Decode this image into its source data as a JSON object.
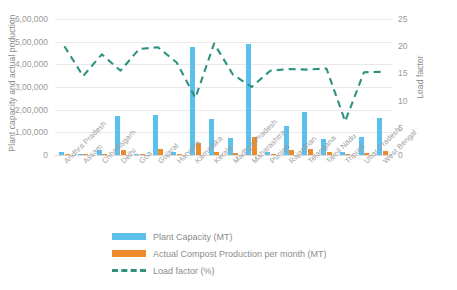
{
  "chart_data": {
    "type": "bar",
    "title": "",
    "xlabel": "",
    "ylabel": "Plant capacity and actual poduction",
    "y2label": "Load factor",
    "ylim": [
      0,
      600000
    ],
    "y2lim": [
      0,
      25
    ],
    "grid": true,
    "legend_position": "bottom",
    "categories": [
      "Andhra Pradesh",
      "Assam",
      "Chhattisgarh",
      "Delhi",
      "Goa",
      "Gujarat",
      "Haryana",
      "Karnataka",
      "Kerala",
      "Madhya Pradesh",
      "Maharashtra",
      "Punjab",
      "Rajasthan",
      "Telangana",
      "Tamil Nadu",
      "Tripura",
      "Uttar Pradesh",
      "West Bengal"
    ],
    "yticks": [
      "0",
      "1,00,000",
      "2,00,000",
      "3,00,000",
      "4,00,000",
      "5,00,000",
      "6,00,000"
    ],
    "ytick_values": [
      0,
      100000,
      200000,
      300000,
      400000,
      500000,
      600000
    ],
    "y2ticks": [
      "0",
      "5",
      "10",
      "15",
      "20",
      "25"
    ],
    "y2tick_values": [
      0,
      5,
      10,
      15,
      20,
      25
    ],
    "series": [
      {
        "name": "Plant Capacity (MT)",
        "type": "bar",
        "axis": "left",
        "color": "#5bc0eb",
        "values": [
          13000,
          6000,
          22000,
          172000,
          5000,
          176000,
          12000,
          475000,
          160000,
          76000,
          490000,
          13000,
          130000,
          190000,
          70000,
          14000,
          80000,
          165000
        ]
      },
      {
        "name": "Actual Compost Production per month (MT)",
        "type": "bar",
        "axis": "left",
        "color": "#ed8b2b",
        "values": [
          5000,
          1500,
          4000,
          20000,
          1000,
          26000,
          2000,
          55000,
          12000,
          8000,
          78000,
          3000,
          22000,
          26000,
          14000,
          2000,
          9000,
          17000
        ]
      },
      {
        "name": "Load factor (%)",
        "type": "line",
        "axis": "right",
        "color": "#2e9182",
        "dashed": true,
        "values": [
          20.0,
          14.5,
          18.5,
          15.5,
          19.5,
          19.8,
          17.0,
          10.5,
          20.5,
          14.8,
          12.5,
          15.5,
          15.8,
          15.7,
          15.9,
          6.2,
          15.2,
          15.3
        ]
      }
    ]
  },
  "legend": {
    "items": [
      {
        "label": "Plant Capacity (MT)",
        "swatch": "cap"
      },
      {
        "label": "Actual Compost Production per month (MT)",
        "swatch": "prod"
      },
      {
        "label": "Load factor (%)",
        "swatch": "line"
      }
    ]
  },
  "corner_mark": ""
}
